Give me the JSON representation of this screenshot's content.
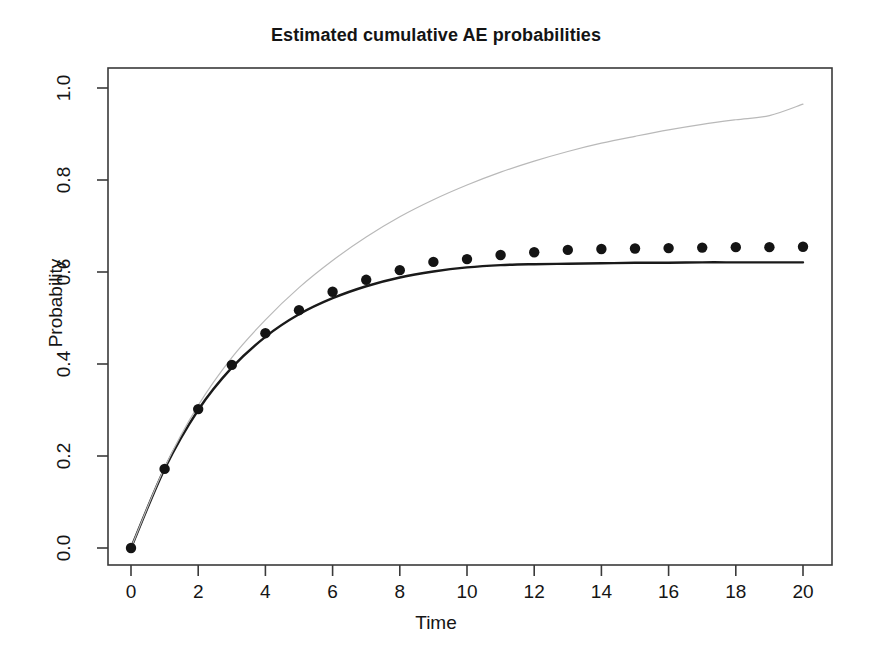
{
  "chart_data": {
    "type": "line",
    "title": "Estimated cumulative AE probabilities",
    "xlabel": "Time",
    "ylabel": "Probability",
    "xlim": [
      0,
      20.4
    ],
    "ylim": [
      0.0,
      1.04
    ],
    "grid": false,
    "legend": "none",
    "xticks": [
      0,
      2,
      4,
      6,
      8,
      10,
      12,
      14,
      16,
      18,
      20
    ],
    "xtick_labels": [
      "0",
      "2",
      "4",
      "6",
      "8",
      "10",
      "12",
      "14",
      "16",
      "18",
      "20"
    ],
    "yticks": [
      0.0,
      0.2,
      0.4,
      0.6,
      0.8,
      1.0
    ],
    "ytick_labels": [
      "0.0",
      "0.2",
      "0.4",
      "0.6",
      "0.8",
      "1.0"
    ],
    "x": [
      0,
      1,
      2,
      3,
      4,
      5,
      6,
      7,
      8,
      9,
      10,
      11,
      12,
      13,
      14,
      15,
      16,
      17,
      18,
      19,
      20
    ],
    "series": [
      {
        "name": "Nonparametric estimate",
        "style": "points",
        "marker": "filled-circle",
        "color": "#141414",
        "values": [
          0.0,
          0.172,
          0.302,
          0.398,
          0.467,
          0.517,
          0.557,
          0.583,
          0.604,
          0.622,
          0.628,
          0.637,
          0.643,
          0.648,
          0.65,
          0.651,
          0.652,
          0.653,
          0.654,
          0.654,
          0.655
        ]
      },
      {
        "name": "Parametric model fit",
        "style": "line",
        "color": "#1a1a1a",
        "linewidth": 2.4,
        "values": [
          0.0,
          0.172,
          0.3,
          0.392,
          0.459,
          0.508,
          0.543,
          0.569,
          0.588,
          0.601,
          0.61,
          0.615,
          0.617,
          0.618,
          0.619,
          0.62,
          0.62,
          0.621,
          0.621,
          0.621,
          0.621
        ]
      },
      {
        "name": "Naive cumulative incidence",
        "style": "line",
        "color": "#b9b9b9",
        "linewidth": 1.2,
        "values": [
          0.0,
          0.175,
          0.31,
          0.414,
          0.496,
          0.566,
          0.625,
          0.676,
          0.72,
          0.757,
          0.789,
          0.817,
          0.841,
          0.862,
          0.88,
          0.895,
          0.909,
          0.921,
          0.931,
          0.94,
          0.965
        ]
      }
    ]
  },
  "axes": {
    "x_axis_name": "Time",
    "y_axis_name": "Probability"
  }
}
